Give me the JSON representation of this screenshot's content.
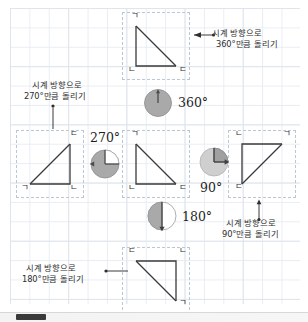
{
  "page": {
    "background_color": "#ffffff",
    "grid_color": "#e9edf2",
    "cell_border_color": "#b9c7d6",
    "ink_color": "#2e2e2e",
    "pie_fill_color": "#a9a9a9",
    "pie_empty_color": "#c9c9c9"
  },
  "vertex_labels": {
    "a": "ㄱ",
    "b": "ㄴ",
    "c": "ㄷ"
  },
  "figures": [
    {
      "id": "triangle-top",
      "name": "triangle-360",
      "rotation_degrees": 360,
      "vertices": {
        "top_left": "ㄱ",
        "bottom_left": "ㄴ",
        "bottom_right": "ㄷ"
      }
    },
    {
      "id": "triangle-left",
      "name": "triangle-270",
      "rotation_degrees": 270,
      "vertices": {
        "top_right": "ㄷ",
        "bottom_left": "ㄱ",
        "bottom_right": "ㄴ"
      }
    },
    {
      "id": "triangle-center",
      "name": "triangle-original",
      "rotation_degrees": 0,
      "vertices": {
        "top_left": "ㄱ",
        "bottom_left": "ㄴ",
        "bottom_right": "ㄷ"
      }
    },
    {
      "id": "triangle-right",
      "name": "triangle-90",
      "rotation_degrees": 90,
      "vertices": {
        "top_left": "ㄴ",
        "top_right": "ㄱ",
        "bottom_left": "ㄷ"
      }
    },
    {
      "id": "triangle-bottom",
      "name": "triangle-180",
      "rotation_degrees": 180,
      "vertices": {
        "top_left": "ㄷ",
        "top_right": "ㄴ",
        "bottom_right": "ㄱ"
      }
    }
  ],
  "dials": [
    {
      "id": "dial-360",
      "label": "360°",
      "fraction": 1.0
    },
    {
      "id": "dial-270",
      "label": "270°",
      "fraction": 0.75
    },
    {
      "id": "dial-90",
      "label": "90°",
      "fraction": 0.25
    },
    {
      "id": "dial-180",
      "label": "180°",
      "fraction": 0.5
    }
  ],
  "callouts": [
    {
      "id": "callout-360",
      "line1": "시계 방향으로",
      "line2": "360°만큼 돌리기",
      "arrow": "left"
    },
    {
      "id": "callout-270",
      "line1": "시계 방향으로",
      "line2": "270°만큼 돌리기",
      "arrow": "down"
    },
    {
      "id": "callout-90",
      "line1": "시계 방향으로",
      "line2": "90°만큼 돌리기",
      "arrow": "up"
    },
    {
      "id": "callout-180",
      "line1": "시계 방향으로",
      "line2": "180°만큼 돌리기",
      "arrow": "right"
    }
  ]
}
